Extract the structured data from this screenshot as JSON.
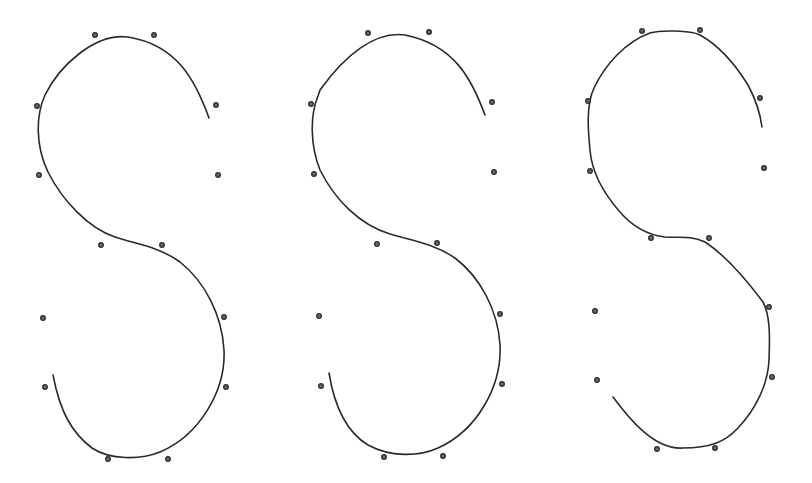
{
  "figure": {
    "colors": {
      "curve": "#2a2a2a",
      "point": "#2a2a2a",
      "background": "#ffffff"
    },
    "panels": [
      {
        "id": "s-left",
        "path": "M209,118 C196,82 178,45 128,37 C95,33 60,65 45,95 C36,115 35,145 48,172 C62,200 88,228 115,237 C135,244 158,246 180,262 C205,282 222,315 224,350 C226,390 200,435 160,452 C140,460 110,460 92,448 C72,433 60,412 53,375",
        "points": [
          [
            95,
            35
          ],
          [
            154,
            35
          ],
          [
            37,
            106
          ],
          [
            216,
            105
          ],
          [
            39,
            175
          ],
          [
            218,
            175
          ],
          [
            101,
            245
          ],
          [
            162,
            245
          ],
          [
            43,
            318
          ],
          [
            224,
            317
          ],
          [
            45,
            387
          ],
          [
            226,
            387
          ],
          [
            108,
            459
          ],
          [
            168,
            459
          ]
        ]
      },
      {
        "id": "s-middle",
        "path": "M485,115 C472,80 455,45 405,35 C375,31 345,55 320,90 L318,96 C310,115 310,145 320,170 C335,200 360,225 390,234 C410,240 433,243 455,258 C480,277 498,310 500,345 C502,385 478,430 438,448 C418,457 390,457 368,445 C348,433 335,410 329,373",
        "points": [
          [
            368,
            33
          ],
          [
            429,
            32
          ],
          [
            311,
            104
          ],
          [
            492,
            102
          ],
          [
            314,
            174
          ],
          [
            494,
            172
          ],
          [
            377,
            244
          ],
          [
            437,
            243
          ],
          [
            319,
            316
          ],
          [
            500,
            314
          ],
          [
            321,
            386
          ],
          [
            502,
            384
          ],
          [
            384,
            457
          ],
          [
            443,
            456
          ]
        ]
      },
      {
        "id": "s-right",
        "path": "M762,127 C760,112 755,98 748,85 C735,64 718,45 700,35 C690,30 660,30 650,33 C625,42 605,65 594,88 C586,105 588,130 590,150 C592,175 605,195 620,212 C632,226 648,235 665,237 C680,238 690,235 705,242 C725,255 745,278 763,302 C770,315 770,335 769,360 C768,385 755,410 738,428 C725,442 710,448 683,448 C655,450 630,420 613,397",
        "points": [
          [
            642,
            31
          ],
          [
            700,
            30
          ],
          [
            588,
            101
          ],
          [
            760,
            98
          ],
          [
            590,
            171
          ],
          [
            764,
            168
          ],
          [
            651,
            238
          ],
          [
            709,
            238
          ],
          [
            595,
            311
          ],
          [
            769,
            307
          ],
          [
            597,
            380
          ],
          [
            772,
            377
          ],
          [
            657,
            449
          ],
          [
            715,
            448
          ]
        ]
      }
    ]
  }
}
